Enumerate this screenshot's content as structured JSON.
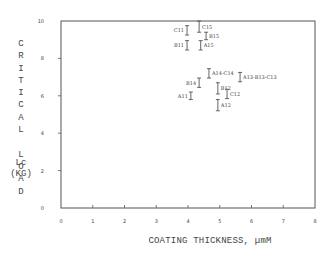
{
  "chart_data": {
    "type": "scatter",
    "title": "",
    "xlabel": "COATING THICKNESS, µmM",
    "ylabel": "CRITICAL LOAD Lc (KG)",
    "ylabel_word": "CRITICAL LOAD",
    "ylabel_unit_line1": "Lc",
    "ylabel_unit_line2": "(KG)",
    "xlim": [
      0,
      8
    ],
    "ylim": [
      0,
      10
    ],
    "xticks": [
      0,
      1,
      2,
      3,
      4,
      5,
      6,
      7,
      8
    ],
    "yticks": [
      0,
      2,
      4,
      6,
      8,
      10
    ],
    "grid": false,
    "legend": null,
    "marker": "error-bar",
    "points": [
      {
        "label": "C11",
        "x": 3.97,
        "y": 9.5,
        "err": 0.25,
        "label_side": "left"
      },
      {
        "label": "C15",
        "x": 4.35,
        "y": 9.7,
        "err": 0.3,
        "label_side": "right"
      },
      {
        "label": "B15",
        "x": 4.57,
        "y": 9.2,
        "err": 0.2,
        "label_side": "right"
      },
      {
        "label": "B11",
        "x": 3.97,
        "y": 8.7,
        "err": 0.25,
        "label_side": "left"
      },
      {
        "label": "A15",
        "x": 4.4,
        "y": 8.7,
        "err": 0.25,
        "label_side": "right"
      },
      {
        "label": "A14-C14",
        "x": 4.66,
        "y": 7.2,
        "err": 0.25,
        "label_side": "right"
      },
      {
        "label": "A13-B13-C13",
        "x": 5.64,
        "y": 7.0,
        "err": 0.25,
        "label_side": "right"
      },
      {
        "label": "B14",
        "x": 4.35,
        "y": 6.7,
        "err": 0.25,
        "label_side": "left"
      },
      {
        "label": "B12",
        "x": 4.94,
        "y": 6.4,
        "err": 0.3,
        "label_side": "right"
      },
      {
        "label": "C12",
        "x": 5.23,
        "y": 6.1,
        "err": 0.25,
        "label_side": "right"
      },
      {
        "label": "A11",
        "x": 4.09,
        "y": 6.0,
        "err": 0.2,
        "label_side": "left"
      },
      {
        "label": "A12",
        "x": 4.94,
        "y": 5.5,
        "err": 0.3,
        "label_side": "right"
      }
    ]
  },
  "colors": {
    "axis": "#555555",
    "text": "#444444",
    "background": "#ffffff"
  }
}
